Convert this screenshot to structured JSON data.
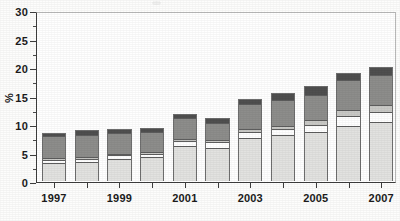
{
  "chart_data": {
    "type": "bar",
    "stacked": true,
    "title": "",
    "subtitle": "",
    "xlabel": "",
    "ylabel": "%",
    "ylim": [
      0,
      30
    ],
    "ytick_values": [
      0,
      5,
      10,
      15,
      20,
      25,
      30
    ],
    "ytick_labels": [
      "0",
      "5",
      "10",
      "15",
      "20",
      "25",
      "30"
    ],
    "yminor_step": 2.5,
    "grid": false,
    "legend": "none",
    "categories": [
      "1997",
      "1998",
      "1999",
      "2000",
      "2001",
      "2002",
      "2003",
      "2004",
      "2005",
      "2006",
      "2007"
    ],
    "xtick_labels_shown": [
      "1997",
      "",
      "1999",
      "",
      "2001",
      "",
      "2003",
      "",
      "2005",
      "",
      "2007"
    ],
    "series": [
      {
        "name": "segment-1",
        "color": "#e2e2e0",
        "values": [
          3.1,
          3.3,
          3.9,
          4.2,
          6.1,
          5.7,
          7.5,
          8.0,
          8.5,
          9.7,
          10.3
        ]
      },
      {
        "name": "segment-2",
        "color": "#ffffff",
        "values": [
          0.6,
          0.6,
          0.6,
          0.6,
          0.9,
          1.1,
          1.1,
          1.1,
          1.4,
          1.7,
          1.8
        ]
      },
      {
        "name": "segment-3",
        "color": "#c9c9c6",
        "values": [
          0.3,
          0.3,
          0.3,
          0.3,
          0.4,
          0.4,
          0.5,
          0.6,
          0.8,
          1.1,
          1.2
        ]
      },
      {
        "name": "segment-4",
        "color": "#8d8d8b",
        "values": [
          3.9,
          4.0,
          3.6,
          3.5,
          3.7,
          3.1,
          4.4,
          4.5,
          4.5,
          5.3,
          5.3
        ]
      },
      {
        "name": "segment-5",
        "color": "#4f4f4f",
        "values": [
          0.6,
          0.8,
          0.8,
          0.8,
          0.8,
          0.8,
          1.0,
          1.3,
          1.6,
          1.2,
          1.4
        ]
      }
    ],
    "totals": [
      8.5,
      9.0,
      9.2,
      9.4,
      11.9,
      11.1,
      14.5,
      15.5,
      16.8,
      19.0,
      20.0
    ]
  },
  "axis": {
    "y_title": "%"
  }
}
